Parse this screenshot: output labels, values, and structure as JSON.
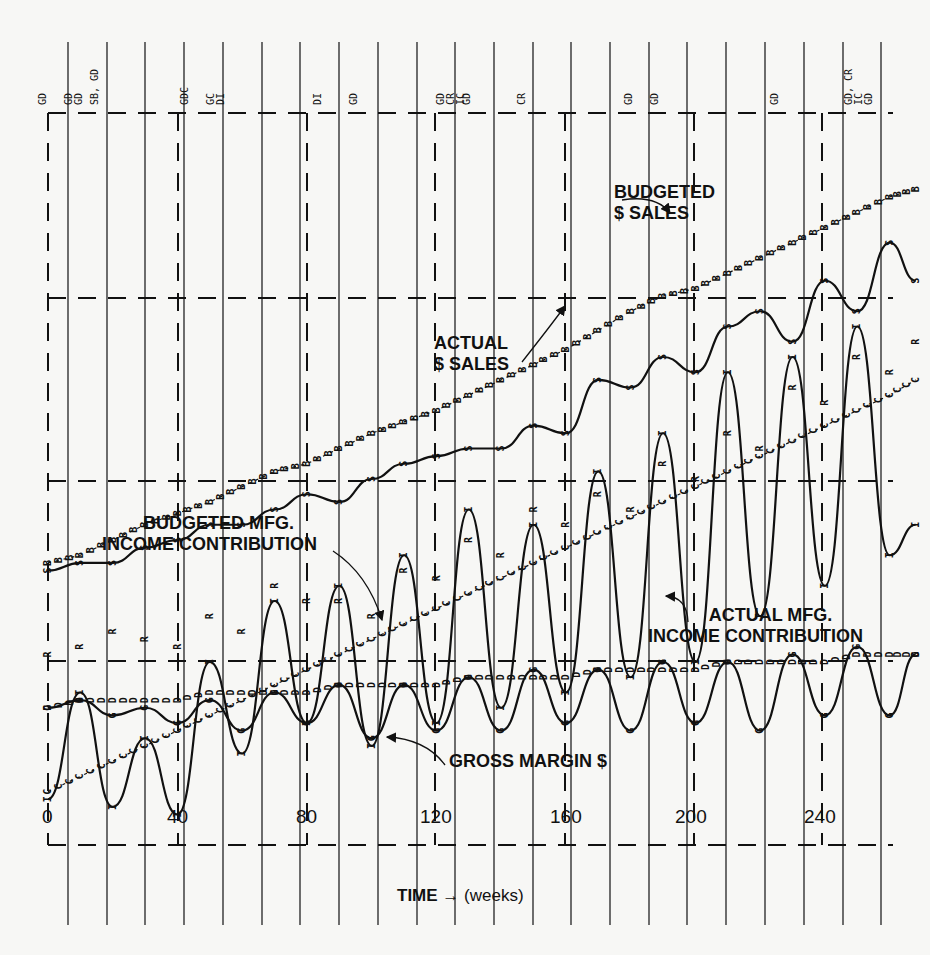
{
  "chart_data": {
    "type": "line",
    "title": "",
    "xlabel": "TIME → (weeks)",
    "xlabel_bold": "TIME",
    "xlabel_arrow": "→",
    "xlabel_unit": "(weeks)",
    "ylabel": "",
    "xlim": [
      0,
      270
    ],
    "x_ticks": [
      0,
      40,
      80,
      120,
      160,
      200,
      240
    ],
    "grid": true,
    "legend_position": "inline annotations",
    "annotations": [
      {
        "id": "budgeted_sales",
        "line1": "BUDGETED",
        "line2": "$ SALES"
      },
      {
        "id": "actual_sales",
        "line1": "ACTUAL",
        "line2": "$ SALES"
      },
      {
        "id": "budgeted_income",
        "line1": "BUDGETED MFG.",
        "line2": "INCOME CONTRIBUTION"
      },
      {
        "id": "actual_income",
        "line1": "ACTUAL MFG.",
        "line2": "INCOME CONTRIBUTION"
      },
      {
        "id": "gross_margin",
        "line1": "GROSS MARGIN $",
        "line2": ""
      }
    ],
    "top_event_tags": [
      {
        "week": 0,
        "text": "GD"
      },
      {
        "week": 8,
        "text": "GD\nGD"
      },
      {
        "week": 16,
        "text": "SB, GD"
      },
      {
        "week": 44,
        "text": "GDC"
      },
      {
        "week": 52,
        "text": "GC\nDI"
      },
      {
        "week": 85,
        "text": "DI"
      },
      {
        "week": 96,
        "text": "GD"
      },
      {
        "week": 123,
        "text": "GD\nCR\nIC"
      },
      {
        "week": 131,
        "text": "GD"
      },
      {
        "week": 148,
        "text": "CR"
      },
      {
        "week": 181,
        "text": "GD"
      },
      {
        "week": 189,
        "text": "GD"
      },
      {
        "week": 226,
        "text": "GD"
      },
      {
        "week": 249,
        "text": "GD, CR\nIC\nGD"
      }
    ],
    "x": [
      0,
      10,
      20,
      30,
      40,
      50,
      60,
      70,
      80,
      90,
      100,
      110,
      120,
      130,
      140,
      150,
      160,
      170,
      180,
      190,
      200,
      210,
      220,
      230,
      240,
      250,
      260,
      268
    ],
    "series": [
      {
        "name": "Budgeted $ Sales",
        "symbol": "B",
        "values": [
          33,
          34,
          36,
          38,
          39.5,
          41,
          43,
          45,
          46,
          48,
          50,
          51.5,
          53,
          55,
          57,
          59,
          61,
          63.5,
          66,
          68,
          69,
          71,
          73,
          75,
          77,
          79,
          81,
          82
        ]
      },
      {
        "name": "Actual $ Sales",
        "symbol": "S",
        "values": [
          32,
          33,
          33,
          35,
          36,
          38,
          38,
          40,
          42,
          41,
          44,
          46,
          47,
          48,
          48,
          51,
          50,
          57,
          56,
          60,
          58,
          64,
          66,
          62,
          70,
          66,
          75,
          70
        ]
      },
      {
        "name": "Budgeted Mfg. Income Contribution",
        "symbol": "C",
        "values": [
          3,
          5,
          7,
          9,
          11,
          13,
          15,
          17,
          19,
          21,
          23,
          25,
          27,
          29,
          31,
          33,
          35,
          37,
          39,
          41,
          43,
          45,
          47,
          49,
          51,
          53,
          55,
          57
        ]
      },
      {
        "name": "Actual Mfg. Income Contribution",
        "symbol": "I",
        "values": [
          2,
          16,
          1,
          10,
          0,
          20,
          8,
          28,
          12,
          30,
          9,
          34,
          12,
          40,
          14,
          38,
          16,
          45,
          18,
          50,
          20,
          58,
          26,
          60,
          30,
          64,
          34,
          38
        ]
      },
      {
        "name": "Gross Margin $",
        "symbol": "G",
        "values": [
          14,
          15,
          13,
          14,
          12,
          15,
          11,
          16,
          12,
          17,
          10,
          17,
          11,
          18,
          11,
          19,
          12,
          19,
          11,
          20,
          12,
          20,
          11,
          21,
          13,
          22,
          13,
          21
        ]
      },
      {
        "name": "R series",
        "symbol": "R",
        "values": [
          21,
          22,
          24,
          23,
          22,
          26,
          24,
          30,
          28,
          28,
          26,
          32,
          31,
          36,
          34,
          40,
          38,
          42,
          40,
          46,
          44,
          50,
          48,
          56,
          54,
          60,
          58,
          62
        ]
      },
      {
        "name": "D series",
        "symbol": "D",
        "values": [
          14,
          15,
          15,
          15,
          15,
          16,
          16,
          16,
          16,
          17,
          17,
          17,
          17,
          18,
          18,
          18,
          18,
          19,
          19,
          19,
          19,
          20,
          20,
          20,
          20,
          21,
          21,
          21
        ]
      }
    ]
  },
  "axis": {
    "ticks": [
      "0",
      "40",
      "80",
      "120",
      "160",
      "200",
      "240"
    ]
  }
}
